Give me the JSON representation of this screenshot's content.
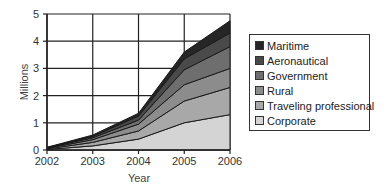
{
  "chart_data": {
    "type": "area",
    "stacked": true,
    "title": "",
    "xlabel": "Year",
    "ylabel": "Millions",
    "x": [
      "2002",
      "2003",
      "2004",
      "2005",
      "2006"
    ],
    "ylim": [
      0,
      5
    ],
    "yticks": [
      "0",
      "1",
      "2",
      "3",
      "4",
      "5"
    ],
    "grid": true,
    "legend_position": "right",
    "series": [
      {
        "name": "Corporate",
        "color": "#d4d4d4",
        "values": [
          0.02,
          0.15,
          0.4,
          1.0,
          1.3
        ]
      },
      {
        "name": "Traveling professional",
        "color": "#a8a8a8",
        "values": [
          0.02,
          0.13,
          0.3,
          0.8,
          1.0
        ]
      },
      {
        "name": "Rural",
        "color": "#8c8c8c",
        "values": [
          0.02,
          0.1,
          0.25,
          0.6,
          0.7
        ]
      },
      {
        "name": "Government",
        "color": "#6e6e6e",
        "values": [
          0.02,
          0.07,
          0.15,
          0.55,
          0.8
        ]
      },
      {
        "name": "Aeronautical",
        "color": "#4a4a4a",
        "values": [
          0.01,
          0.05,
          0.15,
          0.4,
          0.5
        ]
      },
      {
        "name": "Maritime",
        "color": "#262626",
        "values": [
          0.01,
          0.05,
          0.1,
          0.25,
          0.45
        ]
      }
    ]
  },
  "legend": {
    "items": [
      {
        "label": "Maritime",
        "color": "#262626"
      },
      {
        "label": "Aeronautical",
        "color": "#4a4a4a"
      },
      {
        "label": "Government",
        "color": "#6e6e6e"
      },
      {
        "label": "Rural",
        "color": "#8c8c8c"
      },
      {
        "label": "Traveling professional",
        "color": "#a8a8a8"
      },
      {
        "label": "Corporate",
        "color": "#d4d4d4"
      }
    ]
  }
}
